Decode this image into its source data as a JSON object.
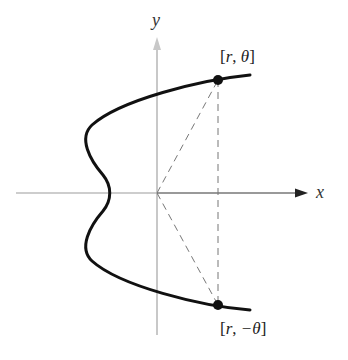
{
  "diagram": {
    "axes": {
      "x_label": "x",
      "y_label": "y"
    },
    "points": [
      {
        "label_open": "[",
        "label_r": "r",
        "label_sep": ", ",
        "label_angle": "θ",
        "label_close": "]",
        "name": "point-r-theta"
      },
      {
        "label_open": "[",
        "label_r": "r",
        "label_sep": ", ",
        "label_angle": "−θ",
        "label_close": "]",
        "name": "point-r-neg-theta"
      }
    ],
    "colors": {
      "curve": "#111111",
      "axis_y": "#c8c8c8",
      "axis_x": "#888888",
      "dashed": "#777777",
      "point": "#111111"
    }
  }
}
